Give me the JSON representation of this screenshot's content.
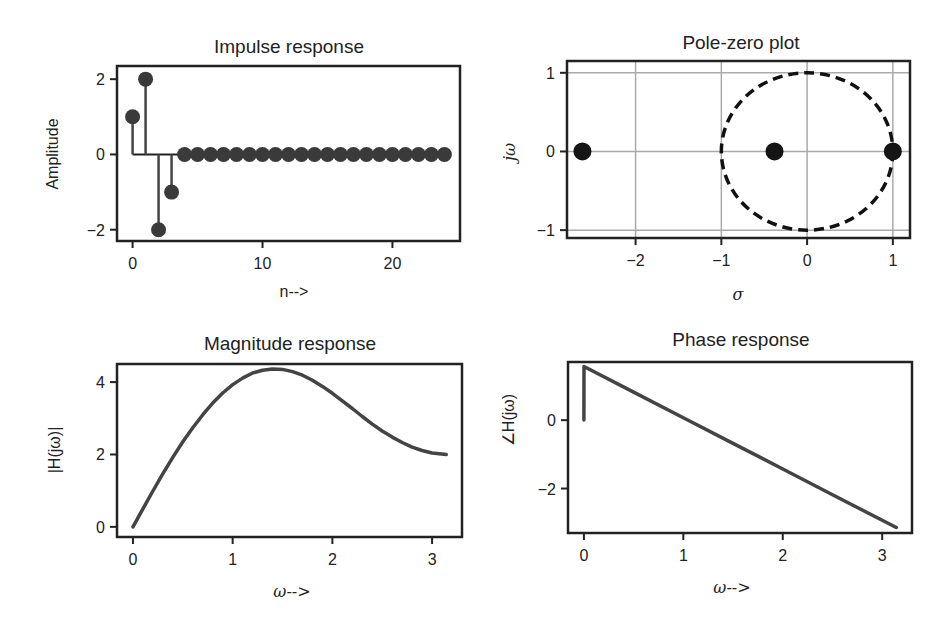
{
  "chart_data": [
    {
      "id": "impulse",
      "type": "stem",
      "title": "Impulse response",
      "xlabel": "n-->",
      "ylabel": "Amplitude",
      "x": [
        0,
        1,
        2,
        3,
        4,
        5,
        6,
        7,
        8,
        9,
        10,
        11,
        12,
        13,
        14,
        15,
        16,
        17,
        18,
        19,
        20,
        21,
        22,
        23,
        24
      ],
      "values": [
        1,
        2,
        -2,
        -1,
        0,
        0,
        0,
        0,
        0,
        0,
        0,
        0,
        0,
        0,
        0,
        0,
        0,
        0,
        0,
        0,
        0,
        0,
        0,
        0,
        0
      ],
      "xticks": [
        0,
        10,
        20
      ],
      "yticks": [
        -2,
        0,
        2
      ],
      "xlim": [
        -1.2,
        25.2
      ],
      "ylim": [
        -2.3,
        2.35
      ],
      "grid": false
    },
    {
      "id": "polezero",
      "type": "scatter",
      "title": "Pole-zero plot",
      "xlabel": "σ",
      "ylabel": "jω",
      "points": [
        {
          "x": -2.62,
          "y": 0
        },
        {
          "x": -0.38,
          "y": 0
        },
        {
          "x": 1.0,
          "y": 0
        }
      ],
      "unit_circle": {
        "cx": 0,
        "cy": 0,
        "r": 1,
        "style": "dashed"
      },
      "xticks": [
        -2,
        -1,
        0,
        1
      ],
      "yticks": [
        -1,
        0,
        1
      ],
      "xlim": [
        -2.8,
        1.2
      ],
      "ylim": [
        -1.1,
        1.15
      ],
      "grid": true
    },
    {
      "id": "magnitude",
      "type": "line",
      "title": "Magnitude response",
      "xlabel": "ω-->",
      "ylabel": "|H(jω)|",
      "x": [
        0,
        0.1,
        0.2,
        0.3,
        0.4,
        0.5,
        0.6,
        0.7,
        0.8,
        0.9,
        1.0,
        1.1,
        1.2,
        1.3,
        1.4,
        1.5,
        1.6,
        1.7,
        1.8,
        1.9,
        2.0,
        2.1,
        2.2,
        2.3,
        2.4,
        2.5,
        2.6,
        2.7,
        2.8,
        2.9,
        3.0,
        3.1416
      ],
      "values": [
        0,
        0.5,
        0.99,
        1.47,
        1.92,
        2.35,
        2.74,
        3.1,
        3.42,
        3.7,
        3.93,
        4.11,
        4.25,
        4.33,
        4.36,
        4.35,
        4.29,
        4.19,
        4.05,
        3.88,
        3.69,
        3.48,
        3.27,
        3.05,
        2.84,
        2.65,
        2.48,
        2.33,
        2.2,
        2.11,
        2.04,
        2.0
      ],
      "xticks": [
        0,
        1,
        2,
        3
      ],
      "yticks": [
        0,
        2,
        4
      ],
      "xlim": [
        -0.16,
        3.3
      ],
      "ylim": [
        -0.28,
        4.5
      ],
      "grid": false
    },
    {
      "id": "phase",
      "type": "line",
      "title": "Phase response",
      "xlabel": "ω-->",
      "ylabel": "∠H(jω)",
      "x": [
        0,
        0.001,
        0.5,
        1.0,
        1.5,
        2.0,
        2.5,
        3.0,
        3.1416
      ],
      "values": [
        0,
        1.569,
        0.82,
        0.07,
        -0.68,
        -1.43,
        -2.18,
        -2.93,
        -3.14
      ],
      "xticks": [
        0,
        1,
        2,
        3
      ],
      "yticks": [
        -2,
        0
      ],
      "xlim": [
        -0.16,
        3.3
      ],
      "ylim": [
        -3.3,
        1.7
      ],
      "grid": false
    }
  ],
  "labels": {
    "impulse": {
      "title": "Impulse response",
      "xlabel": "n-->",
      "ylabel": "Amplitude"
    },
    "polezero": {
      "title": "Pole-zero plot",
      "xlabel": "σ",
      "ylabel": "jω"
    },
    "magnitude": {
      "title": "Magnitude response",
      "xlabel": "ω-->",
      "ylabel": "|H(jω)|"
    },
    "phase": {
      "title": "Phase response",
      "xlabel": "ω-->",
      "ylabel": "∠H(jω)"
    }
  }
}
